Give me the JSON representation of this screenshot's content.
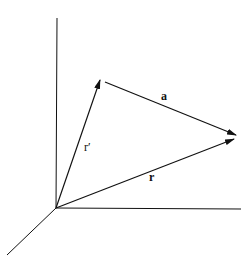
{
  "diagram": {
    "type": "vector-diagram",
    "axes": [
      "vertical-axis",
      "horizontal-axis",
      "depth-axis"
    ],
    "labels": {
      "r_prime": "r′",
      "r": "r",
      "a": "a"
    },
    "colors": {
      "line": "#111111",
      "background": "#ffffff"
    }
  }
}
